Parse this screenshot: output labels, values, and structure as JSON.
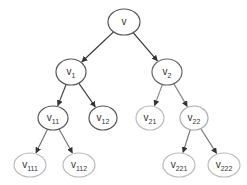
{
  "diagram": {
    "type": "tree",
    "nodes": [
      {
        "id": "v",
        "base": "v",
        "sub": "",
        "x": 124,
        "y": 22,
        "rx": 16,
        "ry": 13,
        "stroke": "#555555"
      },
      {
        "id": "v1",
        "base": "v",
        "sub": "1",
        "x": 71,
        "y": 72,
        "rx": 15,
        "ry": 13,
        "stroke": "#555555"
      },
      {
        "id": "v2",
        "base": "v",
        "sub": "2",
        "x": 167,
        "y": 72,
        "rx": 15,
        "ry": 13,
        "stroke": "#666666"
      },
      {
        "id": "v11",
        "base": "v",
        "sub": "11",
        "x": 53,
        "y": 118,
        "rx": 15,
        "ry": 12,
        "stroke": "#555555"
      },
      {
        "id": "v12",
        "base": "v",
        "sub": "12",
        "x": 103,
        "y": 118,
        "rx": 14,
        "ry": 12,
        "stroke": "#555555"
      },
      {
        "id": "v21",
        "base": "v",
        "sub": "21",
        "x": 150,
        "y": 118,
        "rx": 14,
        "ry": 12,
        "stroke": "#bbbbbb"
      },
      {
        "id": "v22",
        "base": "v",
        "sub": "22",
        "x": 194,
        "y": 118,
        "rx": 14,
        "ry": 12,
        "stroke": "#aaaaaa"
      },
      {
        "id": "v111",
        "base": "v",
        "sub": "111",
        "x": 30,
        "y": 165,
        "rx": 16,
        "ry": 12,
        "stroke": "#bbbbbb"
      },
      {
        "id": "v112",
        "base": "v",
        "sub": "112",
        "x": 79,
        "y": 165,
        "rx": 16,
        "ry": 12,
        "stroke": "#bbbbbb"
      },
      {
        "id": "v221",
        "base": "v",
        "sub": "221",
        "x": 179,
        "y": 165,
        "rx": 16,
        "ry": 12,
        "stroke": "#bbbbbb"
      },
      {
        "id": "v222",
        "base": "v",
        "sub": "222",
        "x": 224,
        "y": 165,
        "rx": 16,
        "ry": 12,
        "stroke": "#bbbbbb"
      }
    ],
    "edges": [
      {
        "from": "v",
        "to": "v1",
        "color": "#333333"
      },
      {
        "from": "v",
        "to": "v2",
        "color": "#333333"
      },
      {
        "from": "v1",
        "to": "v11",
        "color": "#444444"
      },
      {
        "from": "v1",
        "to": "v12",
        "color": "#444444"
      },
      {
        "from": "v2",
        "to": "v21",
        "color": "#888888"
      },
      {
        "from": "v2",
        "to": "v22",
        "color": "#888888"
      },
      {
        "from": "v11",
        "to": "v111",
        "color": "#777777"
      },
      {
        "from": "v11",
        "to": "v112",
        "color": "#777777"
      },
      {
        "from": "v22",
        "to": "v221",
        "color": "#777777"
      },
      {
        "from": "v22",
        "to": "v222",
        "color": "#777777"
      }
    ]
  }
}
